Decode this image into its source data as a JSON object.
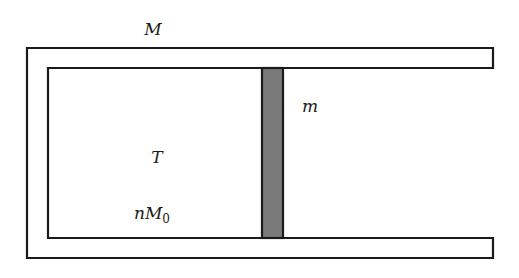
{
  "diagram": {
    "labels": {
      "cylinder_mass": "M",
      "piston_mass": "m",
      "temperature": "T",
      "gas_amount_prefix": "nM",
      "gas_amount_subscript": "0"
    },
    "colors": {
      "outline": "#1a1a1a",
      "piston_fill": "#7a7a7a",
      "background": "#ffffff"
    }
  }
}
